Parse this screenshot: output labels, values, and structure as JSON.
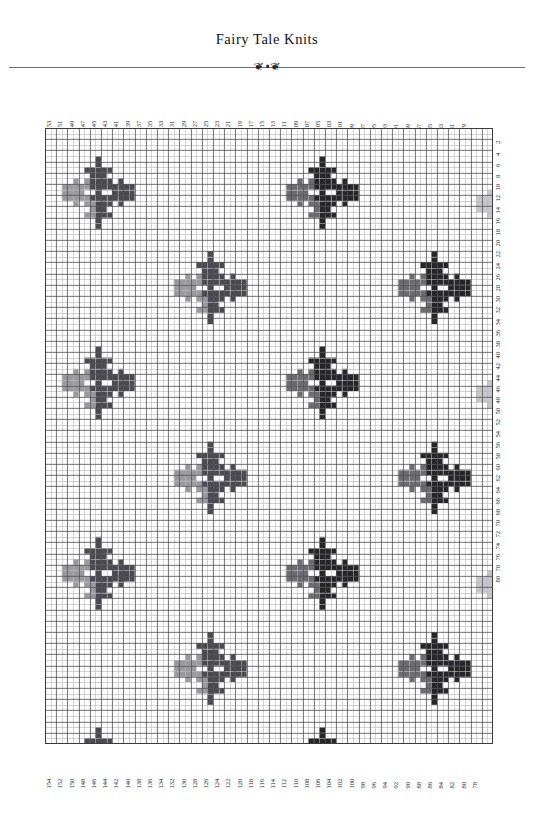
{
  "document": {
    "title": "Fairy Tale Knits",
    "ornament_left": "❦",
    "ornament_right": "❦",
    "ornament_stem": "•"
  },
  "chart_data": {
    "type": "heatmap",
    "title": "Fairy Tale Knits",
    "columns": 80,
    "rows": 110,
    "cell_px": 5.6,
    "grid": true,
    "gridline_color": "#4a4a50",
    "gridline_minor_color": "#b9b9bf",
    "background_color": "#ffffff",
    "legend_position": "none",
    "xlabel": "",
    "ylabel": "",
    "colors": {
      "background": "#ffffff",
      "light_gray": "#9a9a9e",
      "mid_gray": "#6b6b70",
      "dark_gray": "#4a4a50",
      "near_black": "#262628",
      "pale_gray": "#c6c6ca"
    },
    "axis_top": {
      "orientation": "vertical-text",
      "order": "descending",
      "step": -2,
      "parity": "odd",
      "ticks": [
        153,
        151,
        149,
        147,
        145,
        143,
        141,
        139,
        137,
        135,
        133,
        131,
        129,
        127,
        125,
        123,
        121,
        119,
        117,
        115,
        113,
        111,
        109,
        107,
        105,
        103,
        101,
        99,
        97,
        95,
        93,
        91,
        89,
        87,
        85,
        83,
        81,
        79
      ]
    },
    "axis_bottom": {
      "orientation": "vertical-text",
      "order": "descending",
      "step": -2,
      "parity": "even",
      "ticks": [
        154,
        152,
        150,
        148,
        146,
        144,
        142,
        140,
        138,
        136,
        134,
        132,
        130,
        128,
        126,
        124,
        122,
        120,
        118,
        116,
        114,
        112,
        110,
        108,
        106,
        104,
        102,
        100,
        98,
        96,
        94,
        92,
        90,
        88,
        86,
        84,
        82,
        80,
        78
      ]
    },
    "axis_right": {
      "orientation": "vertical-text",
      "order": "ascending",
      "step": 2,
      "parity": "even",
      "ticks": [
        2,
        4,
        6,
        8,
        10,
        12,
        14,
        16,
        18,
        20,
        22,
        24,
        26,
        28,
        30,
        32,
        34,
        36,
        38,
        40,
        42,
        44,
        46,
        48,
        50,
        52,
        54,
        56,
        58,
        60,
        62,
        64,
        66,
        68,
        70,
        72,
        74,
        76,
        78,
        80
      ]
    },
    "motif": {
      "name": "snowflake-star",
      "width": 13,
      "height": 13,
      "shading": "light-gray on left/lower-left, dark on right/upper-right",
      "cells": [
        [
          0,
          0,
          0,
          0,
          0,
          0,
          2,
          0,
          0,
          0,
          0,
          0,
          0
        ],
        [
          0,
          0,
          0,
          0,
          0,
          0,
          2,
          0,
          0,
          0,
          0,
          0,
          0
        ],
        [
          0,
          0,
          0,
          0,
          2,
          2,
          2,
          2,
          2,
          0,
          0,
          0,
          0
        ],
        [
          0,
          0,
          0,
          0,
          0,
          2,
          2,
          2,
          0,
          0,
          0,
          0,
          0
        ],
        [
          0,
          0,
          1,
          0,
          1,
          2,
          2,
          2,
          2,
          0,
          2,
          0,
          0
        ],
        [
          1,
          1,
          1,
          1,
          1,
          2,
          2,
          2,
          2,
          2,
          2,
          2,
          2
        ],
        [
          1,
          1,
          1,
          1,
          0,
          0,
          2,
          0,
          0,
          2,
          2,
          2,
          2
        ],
        [
          1,
          1,
          1,
          1,
          1,
          2,
          2,
          2,
          2,
          2,
          2,
          2,
          2
        ],
        [
          0,
          0,
          1,
          0,
          1,
          1,
          2,
          2,
          2,
          0,
          2,
          0,
          0
        ],
        [
          0,
          0,
          0,
          0,
          0,
          1,
          2,
          2,
          0,
          0,
          0,
          0,
          0
        ],
        [
          0,
          0,
          0,
          0,
          1,
          1,
          2,
          2,
          2,
          0,
          0,
          0,
          0
        ],
        [
          0,
          0,
          0,
          0,
          0,
          0,
          2,
          0,
          0,
          0,
          0,
          0,
          0
        ],
        [
          0,
          0,
          0,
          0,
          0,
          0,
          2,
          0,
          0,
          0,
          0,
          0,
          0
        ]
      ]
    },
    "motif_placements": [
      {
        "col": 3,
        "row": 5,
        "tone": "mid"
      },
      {
        "col": 43,
        "row": 5,
        "tone": "dark"
      },
      {
        "col": 77,
        "row": 7,
        "tone": "pale"
      },
      {
        "col": 23,
        "row": 22,
        "tone": "mid"
      },
      {
        "col": 63,
        "row": 22,
        "tone": "dark"
      },
      {
        "col": 3,
        "row": 39,
        "tone": "mid"
      },
      {
        "col": 43,
        "row": 39,
        "tone": "dark"
      },
      {
        "col": 77,
        "row": 41,
        "tone": "pale"
      },
      {
        "col": 23,
        "row": 56,
        "tone": "mid"
      },
      {
        "col": 63,
        "row": 56,
        "tone": "dark"
      },
      {
        "col": 3,
        "row": 73,
        "tone": "mid"
      },
      {
        "col": 43,
        "row": 73,
        "tone": "dark"
      },
      {
        "col": 77,
        "row": 75,
        "tone": "pale"
      },
      {
        "col": 23,
        "row": 90,
        "tone": "mid"
      },
      {
        "col": 63,
        "row": 90,
        "tone": "dark"
      },
      {
        "col": 3,
        "row": 107,
        "tone": "mid"
      },
      {
        "col": 43,
        "row": 107,
        "tone": "dark"
      },
      {
        "col": 77,
        "row": 109,
        "tone": "pale"
      }
    ]
  }
}
